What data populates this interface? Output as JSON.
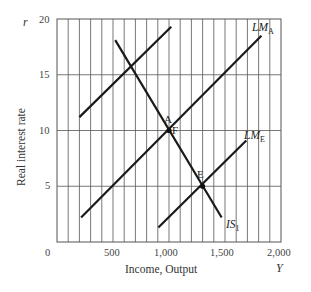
{
  "chart_data": {
    "type": "line",
    "title": "",
    "xlabel": "Income, Output",
    "ylabel": "Real interest rate",
    "x_var": "Y",
    "y_var": "r",
    "xlim": [
      0,
      2000
    ],
    "ylim": [
      0,
      20
    ],
    "x_ticks": [
      0,
      500,
      1000,
      1500,
      2000
    ],
    "x_tick_labels": [
      "0",
      "500",
      "1,000",
      "1,500",
      "2,000"
    ],
    "y_ticks": [
      5,
      10,
      15,
      20
    ],
    "y_tick_labels": [
      "5",
      "10",
      "15",
      "20"
    ],
    "grid": {
      "vertical_step": 100,
      "horizontal_step": 5,
      "on": true
    },
    "legend": null,
    "series": [
      {
        "name": "IS1",
        "label": "IS",
        "subscript": "1",
        "points": [
          [
            520,
            18.1
          ],
          [
            1470,
            2.2
          ]
        ]
      },
      {
        "name": "LM_A",
        "label": "LM",
        "subscript": "A",
        "points": [
          [
            215,
            2.2
          ],
          [
            1825,
            18.5
          ]
        ]
      },
      {
        "name": "LM_E",
        "label": "LM",
        "subscript": "E",
        "points": [
          [
            905,
            1.3
          ],
          [
            1690,
            9.1
          ]
        ]
      },
      {
        "name": "unlabeled upper line",
        "label": "",
        "subscript": "",
        "points": [
          [
            200,
            11.2
          ],
          [
            1020,
            19.3
          ]
        ]
      }
    ],
    "annotations": [
      {
        "text": "A",
        "x": 1000,
        "y": 10,
        "marker": true
      },
      {
        "text": "F",
        "x": 1000,
        "y": 10,
        "marker": false
      },
      {
        "text": "E",
        "x": 1300,
        "y": 5,
        "marker": true
      }
    ]
  },
  "labels": {
    "y_var": "r",
    "x_var": "Y",
    "ylabel": "Real interest rate",
    "xlabel": "Income, Output",
    "origin": "0",
    "x_500": "500",
    "x_1000": "1,000",
    "x_1500": "1,500",
    "x_2000": "2,000",
    "y_5": "5",
    "y_10": "10",
    "y_15": "15",
    "y_20": "20",
    "lma_main": "LM",
    "lma_sub": "A",
    "lme_main": "LM",
    "lme_sub": "E",
    "is_main": "IS",
    "is_sub": "1",
    "point_a": "A",
    "point_f": "F",
    "point_e": "E"
  }
}
